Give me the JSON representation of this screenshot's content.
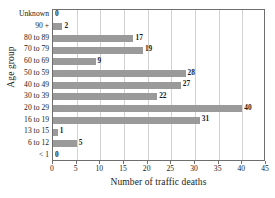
{
  "chart_data": {
    "type": "bar",
    "orientation": "horizontal",
    "title": "",
    "xlabel": "Number of traffic deaths",
    "ylabel": "Age group",
    "categories": [
      "< 1",
      "6 to 12",
      "13 to 15",
      "16 to 19",
      "20 to 29",
      "30 to 39",
      "40 to 49",
      "50 to 59",
      "60 to 69",
      "70 to 79",
      "80 to 89",
      "90 +",
      "Unknown"
    ],
    "values": [
      0,
      5,
      1,
      31,
      40,
      22,
      27,
      28,
      9,
      19,
      17,
      2,
      0
    ],
    "data_labels": [
      "0",
      "5",
      "1",
      "31",
      "40",
      "22",
      "27",
      "28",
      "9",
      "19",
      "17",
      "2",
      "0"
    ],
    "xlim": [
      0,
      45
    ],
    "xticks": [
      0,
      5,
      10,
      15,
      20,
      25,
      30,
      35,
      40,
      45
    ],
    "xtick_labels": [
      "0",
      "5",
      "10",
      "15",
      "20",
      "25",
      "30",
      "35",
      "40",
      "45"
    ],
    "grid": "vertical",
    "legend": "none",
    "bar_color": "#9a9a9a",
    "grid_color": "#d2d2d2",
    "axis_color": "#6e6e6e",
    "text_color": "#1a1a1a"
  }
}
